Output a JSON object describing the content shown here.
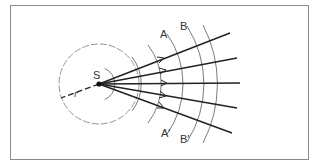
{
  "diagram": {
    "type": "point-source wavefronts and rays",
    "labels": {
      "source": "S",
      "radius": "r",
      "wavefront_a_top": "A",
      "wavefront_b_top": "B",
      "wavefront_a_bottom": "A′",
      "wavefront_b_bottom": "B′"
    },
    "colors": {
      "frame": "#8a8a8a",
      "rays": "#222222",
      "wavefronts": "#7a7a7a",
      "dashed_circle": "#8a8a8a"
    },
    "source": {
      "x": 99,
      "y": 84
    },
    "ray_count": 5
  }
}
